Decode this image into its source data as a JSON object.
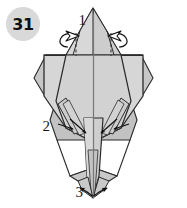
{
  "figure": {
    "kind": "origami-folding-diagram",
    "step_badge": {
      "label": "31",
      "shape": "circle",
      "fill_color": "#d9d9d9",
      "text_color": "#111111",
      "cx": 23,
      "cy": 24,
      "r": 17
    },
    "canvas": {
      "width": 187,
      "height": 208,
      "background": "#ffffff"
    },
    "palette": {
      "paper_light": "#d6d6d6",
      "paper_mid": "#c9c9c9",
      "paper_dark": "#bdbdbd",
      "paper_white": "#ffffff",
      "outline": "#2b2b2b",
      "crease": "#555555",
      "arrow_stroke": "#111111",
      "arrow_fill": "#ffffff"
    },
    "callouts": [
      {
        "id": "callout-1",
        "label": "1",
        "x": 86,
        "y": 25,
        "anchor": "end"
      },
      {
        "id": "callout-2",
        "label": "2",
        "x": 50,
        "y": 131,
        "anchor": "end"
      },
      {
        "id": "callout-3",
        "label": "3",
        "x": 83,
        "y": 197,
        "anchor": "end"
      }
    ],
    "arrows": [
      {
        "id": "arrow-crimp-left",
        "type": "crimp-rotate-arrow",
        "side": "left",
        "direction": "outward-left"
      },
      {
        "id": "arrow-crimp-right",
        "type": "crimp-rotate-arrow",
        "side": "right",
        "direction": "outward-right"
      },
      {
        "id": "arrow-fold-left-inner",
        "type": "valley-fold-arrow",
        "side": "left",
        "direction": "down-right"
      },
      {
        "id": "arrow-fold-left-outer",
        "type": "valley-fold-arrow",
        "side": "left",
        "direction": "right"
      },
      {
        "id": "arrow-fold-right-inner",
        "type": "valley-fold-arrow",
        "side": "right",
        "direction": "down-left"
      },
      {
        "id": "arrow-fold-right-outer",
        "type": "valley-fold-arrow",
        "side": "right",
        "direction": "left"
      },
      {
        "id": "arrow-spread-left",
        "type": "open-spread-arrow",
        "side": "left",
        "direction": "up-left"
      },
      {
        "id": "arrow-spread-right",
        "type": "open-spread-arrow",
        "side": "right",
        "direction": "up-right"
      }
    ],
    "creases": [
      {
        "id": "crease-center-vertical",
        "style": "solid-thin"
      },
      {
        "id": "crease-top-left-dashed",
        "style": "dashed"
      },
      {
        "id": "crease-top-right-dashed",
        "style": "dashed"
      },
      {
        "id": "crease-bottom-left-dashed",
        "style": "dashed"
      },
      {
        "id": "crease-bottom-right-dashed",
        "style": "dashed"
      }
    ]
  }
}
